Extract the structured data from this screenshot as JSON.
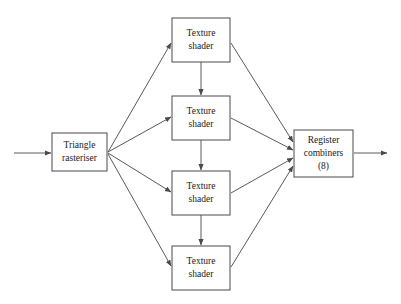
{
  "diagram": {
    "canvas": {
      "width": 401,
      "height": 304,
      "background": "#ffffff"
    },
    "style": {
      "box_stroke": "#4a4a4a",
      "box_fill": "#ffffff",
      "edge_stroke": "#5a5a5a",
      "text_color": "#1a1a1a"
    },
    "nodes": [
      {
        "id": "triangle-rasteriser",
        "name": "triangle-rasteriser-box",
        "lines": [
          "Triangle",
          "rasteriser"
        ],
        "x": 52,
        "y": 133,
        "w": 55,
        "h": 38
      },
      {
        "id": "texture-shader-1",
        "name": "texture-shader-box-1",
        "lines": [
          "Texture",
          "shader"
        ],
        "x": 172,
        "y": 18,
        "w": 58,
        "h": 44
      },
      {
        "id": "texture-shader-2",
        "name": "texture-shader-box-2",
        "lines": [
          "Texture",
          "shader"
        ],
        "x": 172,
        "y": 96,
        "w": 58,
        "h": 44
      },
      {
        "id": "texture-shader-3",
        "name": "texture-shader-box-3",
        "lines": [
          "Texture",
          "shader"
        ],
        "x": 172,
        "y": 171,
        "w": 58,
        "h": 44
      },
      {
        "id": "texture-shader-4",
        "name": "texture-shader-box-4",
        "lines": [
          "Texture",
          "shader"
        ],
        "x": 172,
        "y": 246,
        "w": 58,
        "h": 44
      },
      {
        "id": "register-combiners",
        "name": "register-combiners-box",
        "lines": [
          "Register",
          "combiners",
          "(8)"
        ],
        "x": 294,
        "y": 130,
        "w": 59,
        "h": 47
      }
    ],
    "edges": [
      {
        "id": "input-arrow",
        "name": "input-arrow",
        "x1": 14,
        "y1": 153,
        "x2": 51,
        "y2": 153,
        "arrow": true
      },
      {
        "id": "fan-out-1",
        "name": "edge-rasteriser-to-shader-1",
        "x1": 108,
        "y1": 152,
        "x2": 171,
        "y2": 43,
        "arrow": true
      },
      {
        "id": "fan-out-2",
        "name": "edge-rasteriser-to-shader-2",
        "x1": 108,
        "y1": 152,
        "x2": 171,
        "y2": 117,
        "arrow": true
      },
      {
        "id": "fan-out-3",
        "name": "edge-rasteriser-to-shader-3",
        "x1": 108,
        "y1": 153,
        "x2": 171,
        "y2": 192,
        "arrow": true
      },
      {
        "id": "fan-out-4",
        "name": "edge-rasteriser-to-shader-4",
        "x1": 108,
        "y1": 154,
        "x2": 171,
        "y2": 266,
        "arrow": true
      },
      {
        "id": "chain-1-2",
        "name": "edge-shader-1-to-shader-2",
        "x1": 201,
        "y1": 62,
        "x2": 201,
        "y2": 95,
        "arrow": true
      },
      {
        "id": "chain-2-3",
        "name": "edge-shader-2-to-shader-3",
        "x1": 201,
        "y1": 140,
        "x2": 201,
        "y2": 170,
        "arrow": true
      },
      {
        "id": "chain-3-4",
        "name": "edge-shader-3-to-shader-4",
        "x1": 201,
        "y1": 215,
        "x2": 201,
        "y2": 245,
        "arrow": true
      },
      {
        "id": "fan-in-1",
        "name": "edge-shader-1-to-combiners",
        "x1": 231,
        "y1": 43,
        "x2": 293,
        "y2": 142,
        "arrow": true
      },
      {
        "id": "fan-in-2",
        "name": "edge-shader-2-to-combiners",
        "x1": 231,
        "y1": 118,
        "x2": 293,
        "y2": 150,
        "arrow": true
      },
      {
        "id": "fan-in-3",
        "name": "edge-shader-3-to-combiners",
        "x1": 231,
        "y1": 193,
        "x2": 293,
        "y2": 158,
        "arrow": true
      },
      {
        "id": "fan-in-4",
        "name": "edge-shader-4-to-combiners",
        "x1": 231,
        "y1": 267,
        "x2": 293,
        "y2": 166,
        "arrow": true
      },
      {
        "id": "output-arrow",
        "name": "output-arrow",
        "x1": 354,
        "y1": 153,
        "x2": 387,
        "y2": 153,
        "arrow": true
      }
    ]
  }
}
